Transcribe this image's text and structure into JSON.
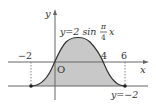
{
  "diagram": {
    "equation": {
      "prefix": "y=2 sin",
      "frac_num": "π",
      "frac_den": "4",
      "var": "x"
    },
    "axis_labels": {
      "x": "x",
      "y": "y",
      "origin": "O"
    },
    "tick_labels": {
      "neg2": "−2",
      "four": "4",
      "six": "6"
    },
    "line_label": "y=−2",
    "colors": {
      "fill": "#c8c8c8",
      "stroke": "#444444",
      "axis": "#666666"
    }
  }
}
